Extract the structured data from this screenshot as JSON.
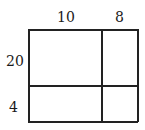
{
  "diagram": {
    "type": "area-model",
    "column_labels": [
      "10",
      "8"
    ],
    "row_labels": [
      "20",
      "4"
    ],
    "line_color": "#222222"
  }
}
